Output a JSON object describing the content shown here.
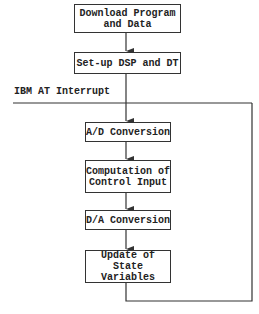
{
  "diagram": {
    "title": "",
    "interrupt_label": "IBM AT Interrupt",
    "nodes": [
      {
        "id": "download",
        "label": "Download Program\nand Data"
      },
      {
        "id": "setup",
        "label": "Set-up DSP and DT"
      },
      {
        "id": "ad",
        "label": "A/D Conversion"
      },
      {
        "id": "compute",
        "label": "Computation of\nControl Input"
      },
      {
        "id": "da",
        "label": "D/A Conversion"
      },
      {
        "id": "update",
        "label": "Update of State\nVariables"
      }
    ],
    "edges": [
      {
        "from": "download",
        "to": "setup"
      },
      {
        "from": "setup",
        "to": "ad",
        "via": "interrupt-line"
      },
      {
        "from": "ad",
        "to": "compute"
      },
      {
        "from": "compute",
        "to": "da"
      },
      {
        "from": "da",
        "to": "update"
      },
      {
        "from": "update",
        "to": "interrupt-line",
        "type": "loop-back"
      }
    ],
    "colors": {
      "line": "#333333",
      "box_border": "#333333",
      "text": "#222222",
      "background": "#ffffff"
    }
  }
}
